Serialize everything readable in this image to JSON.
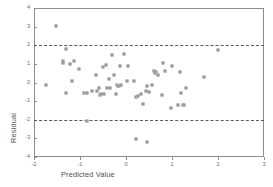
{
  "chart_data": {
    "type": "scatter",
    "title": "",
    "xlabel": "Predicted Value",
    "ylabel": "Residual",
    "xlim": [
      -2,
      3
    ],
    "ylim": [
      -4,
      4
    ],
    "xticks": [
      "-2",
      "-1",
      "0",
      "1",
      "2",
      "3"
    ],
    "xtick_values": [
      -2,
      -1,
      0,
      1,
      2,
      3
    ],
    "yticks": [
      "4",
      "3",
      "2",
      "1",
      "0",
      "-1",
      "-2",
      "-3",
      "-4"
    ],
    "ytick_values": [
      4,
      3,
      2,
      1,
      0,
      -1,
      -2,
      -3,
      -4
    ],
    "grid": false,
    "legend": false,
    "marker": "open-square",
    "marker_color": "#7a7a7a",
    "frame_color": "#8d8d8d",
    "reference_lines": [
      {
        "name": "upper-limit",
        "value": 2,
        "style": "dashed",
        "color": "#5a5a5a"
      },
      {
        "name": "lower-limit",
        "value": -2,
        "style": "dashed",
        "color": "#5a5a5a"
      }
    ],
    "x": [
      -1.52,
      -1.31,
      -1.74,
      -1.36,
      -1.21,
      -1.14,
      -1.18,
      -1.3,
      -1.37,
      -1.03,
      -0.92,
      -0.85,
      -0.73,
      -0.66,
      -0.62,
      -0.58,
      -0.56,
      -0.55,
      -0.5,
      -0.47,
      -0.44,
      -0.41,
      -0.38,
      -0.34,
      -0.3,
      -0.26,
      -0.22,
      -0.19,
      -0.17,
      -0.15,
      -0.13,
      -0.1,
      -0.05,
      0.02,
      0.05,
      0.18,
      0.22,
      0.26,
      0.32,
      0.38,
      0.43,
      0.46,
      0.5,
      0.56,
      0.6,
      0.63,
      0.66,
      0.7,
      0.78,
      0.8,
      0.84,
      0.98,
      1.0,
      1.12,
      1.18,
      1.2,
      1.24,
      1.27,
      1.31,
      1.7,
      2.0,
      -0.85,
      0.22,
      0.45
    ],
    "y": [
      3.05,
      1.82,
      -0.15,
      1.15,
      1.02,
      1.18,
      0.08,
      -0.55,
      1.05,
      0.72,
      -0.58,
      -0.58,
      -0.45,
      0.4,
      -0.45,
      -0.3,
      -0.68,
      -0.62,
      0.82,
      -0.62,
      0.92,
      -0.28,
      0.2,
      -0.3,
      1.48,
      0.42,
      -0.62,
      -0.12,
      -0.18,
      -0.2,
      0.9,
      -0.15,
      1.55,
      0.1,
      0.9,
      0.08,
      -0.8,
      -0.72,
      -0.62,
      -1.15,
      -0.48,
      -0.18,
      -0.5,
      -0.15,
      0.62,
      0.5,
      0.55,
      0.42,
      -0.65,
      1.05,
      0.62,
      -1.35,
      0.9,
      -1.22,
      0.55,
      -0.58,
      -1.22,
      -1.2,
      -0.3,
      0.3,
      1.72,
      -2.05,
      -3.05,
      -3.18
    ],
    "n_points": 64
  }
}
